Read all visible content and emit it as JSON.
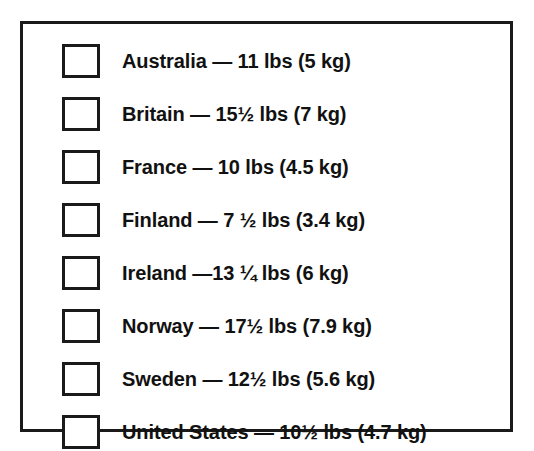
{
  "frame": {
    "border_color": "#1a1a1a",
    "background_color": "#ffffff",
    "text_color": "#111111"
  },
  "checklist": {
    "rows": [
      {
        "checkbox_state": "unchecked",
        "label": "Australia — 11 lbs (5 kg)",
        "country": "Australia",
        "pounds": "11",
        "kilograms": "5 kg"
      },
      {
        "checkbox_state": "unchecked",
        "label": "Britain — 15½ lbs (7 kg)",
        "country": "Britain",
        "pounds": "15½",
        "kilograms": "7 kg"
      },
      {
        "checkbox_state": "unchecked",
        "label": "France — 10 lbs (4.5 kg)",
        "country": "France",
        "pounds": "10",
        "kilograms": "4.5 kg"
      },
      {
        "checkbox_state": "unchecked",
        "label": "Finland — 7 ½ lbs (3.4 kg)",
        "country": "Finland",
        "pounds": "7 ½",
        "kilograms": "3.4 kg"
      },
      {
        "checkbox_state": "unchecked",
        "label": "Ireland —13 ¼ lbs (6 kg)",
        "country": "Ireland",
        "pounds": "13 ¼",
        "kilograms": "6 kg"
      },
      {
        "checkbox_state": "unchecked",
        "label": "Norway — 17½ lbs (7.9 kg)",
        "country": "Norway",
        "pounds": "17½",
        "kilograms": "7.9 kg"
      },
      {
        "checkbox_state": "unchecked",
        "label": "Sweden — 12½ lbs (5.6 kg)",
        "country": "Sweden",
        "pounds": "12½",
        "kilograms": "5.6 kg"
      },
      {
        "checkbox_state": "unchecked",
        "label": "United States — 10½ lbs (4.7 kg)",
        "country": "United States",
        "pounds": "10½",
        "kilograms": "4.7 kg"
      }
    ]
  }
}
